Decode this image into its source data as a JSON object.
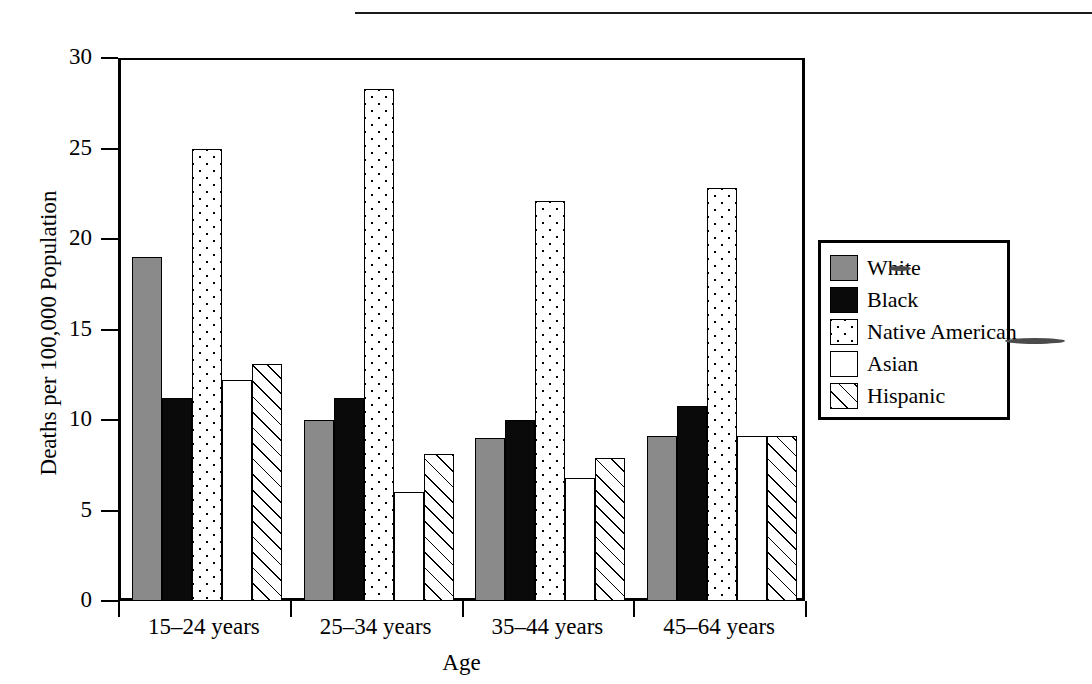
{
  "page": {
    "title_rule_present": true,
    "title_fragment": ""
  },
  "chart_data": {
    "type": "bar",
    "title": "",
    "xlabel": "Age",
    "ylabel": "Deaths per 100,000 Population",
    "categories": [
      "15–24 years",
      "25–34 years",
      "35–44 years",
      "45–64 years"
    ],
    "series": [
      {
        "name": "White",
        "pattern": "solid-gray",
        "color": "#8a8a8a",
        "values": [
          19.0,
          10.0,
          9.0,
          9.1
        ]
      },
      {
        "name": "Black",
        "pattern": "solid-black",
        "color": "#0a0a0a",
        "values": [
          11.2,
          11.2,
          10.0,
          10.8
        ]
      },
      {
        "name": "Native American",
        "pattern": "dotted",
        "color": "#ffffff",
        "values": [
          25.0,
          28.3,
          22.1,
          22.8
        ]
      },
      {
        "name": "Asian",
        "pattern": "empty",
        "color": "#ffffff",
        "values": [
          12.2,
          6.0,
          6.8,
          9.1
        ]
      },
      {
        "name": "Hispanic",
        "pattern": "diagonal-hatch",
        "color": "#ffffff",
        "values": [
          13.1,
          8.1,
          7.9,
          9.1
        ]
      }
    ],
    "ylim": [
      0,
      30
    ],
    "yticks": [
      "0",
      "5",
      "10",
      "15",
      "20",
      "25",
      "30"
    ],
    "ytick_values": [
      0,
      5,
      10,
      15,
      20,
      25,
      30
    ],
    "grid": false,
    "legend_position": "right"
  },
  "axis": {
    "y_title": "Deaths per 100,000 Population",
    "x_title": "Age"
  },
  "legend": {
    "items": [
      {
        "label": "White"
      },
      {
        "label": "Black"
      },
      {
        "label": "Native American"
      },
      {
        "label": "Asian"
      },
      {
        "label": "Hispanic"
      }
    ]
  }
}
